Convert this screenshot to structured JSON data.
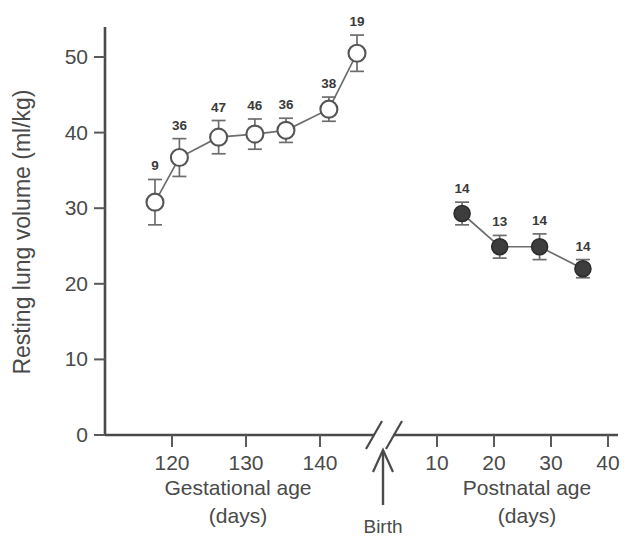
{
  "chart_data": {
    "type": "line",
    "title": "",
    "subtitle": "",
    "ylabel": "Resting lung volume (ml/kg)",
    "ylim": [
      0,
      54
    ],
    "yticks": [
      0,
      10,
      20,
      30,
      40,
      50
    ],
    "ytick_labels": [
      "0",
      "10",
      "20",
      "30",
      "40",
      "50"
    ],
    "grid": false,
    "legend_position": "none",
    "axis_break": true,
    "xaxis": {
      "segments": [
        {
          "name": "gestational",
          "label": "Gestational age",
          "sublabel": "(days)",
          "ticks": [
            120,
            130,
            140
          ],
          "tick_labels": [
            "120",
            "130",
            "140"
          ],
          "range": [
            113,
            147
          ]
        },
        {
          "name": "postnatal",
          "label": "Postnatal age",
          "sublabel": "(days)",
          "ticks": [
            10,
            20,
            30,
            40
          ],
          "tick_labels": [
            "10",
            "20",
            "30",
            "40"
          ],
          "range": [
            3,
            41
          ]
        }
      ]
    },
    "annotations": [
      {
        "name": "birth-marker",
        "text": "Birth",
        "x_segment": "break",
        "description": "upward arrow at axis break indicating birth"
      }
    ],
    "series": [
      {
        "name": "Fetal (gestational)",
        "marker": "open-circle",
        "x": [
          117.7,
          121.0,
          126.3,
          131.2,
          135.4,
          141.2,
          145.0
        ],
        "y": [
          30.8,
          36.7,
          39.4,
          39.8,
          40.3,
          43.1,
          50.5
        ],
        "error": [
          3.0,
          2.5,
          2.2,
          2.0,
          1.6,
          1.6,
          2.4
        ],
        "n_labels": [
          "9",
          "36",
          "47",
          "46",
          "36",
          "38",
          "19"
        ]
      },
      {
        "name": "Newborn (postnatal)",
        "marker": "filled-circle",
        "x": [
          14.4,
          21.0,
          28.0,
          35.6
        ],
        "y": [
          29.3,
          24.9,
          24.9,
          22.0
        ],
        "error": [
          1.5,
          1.5,
          1.7,
          1.2
        ],
        "n_labels": [
          "14",
          "13",
          "14",
          "14"
        ]
      }
    ]
  },
  "colors": {
    "axis": "#4a4a4a",
    "line": "#6d6d6d",
    "open_marker_fill": "#ffffff",
    "filled_marker": "#3d3d3d",
    "text": "#4a4a4a",
    "background": "#ffffff"
  }
}
